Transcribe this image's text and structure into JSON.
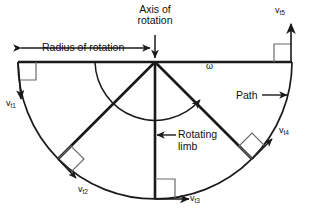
{
  "diagram": {
    "title_note": "Tangential velocity around an axis of rotation",
    "labels": {
      "axis_of_rotation": "Axis of\nrotation",
      "axis_of_rotation_line1": "Axis of",
      "axis_of_rotation_line2": "rotation",
      "radius_of_rotation": "Radius of rotation",
      "path": "Path",
      "rotating_limb_line1": "Rotating",
      "rotating_limb_line2": "limb",
      "angular_velocity_symbol": "ω"
    },
    "velocity_labels": [
      {
        "id": "vt1",
        "base": "v",
        "sub": "t1",
        "angle_deg": 180
      },
      {
        "id": "vt2",
        "base": "v",
        "sub": "t2",
        "angle_deg": 135
      },
      {
        "id": "vt3",
        "base": "v",
        "sub": "t3",
        "angle_deg": 90
      },
      {
        "id": "vt4",
        "base": "v",
        "sub": "t4",
        "angle_deg": 45
      },
      {
        "id": "vt5",
        "base": "v",
        "sub": "t5",
        "angle_deg": 0
      }
    ],
    "geometry": {
      "hub_x": 155,
      "hub_y": 62,
      "radius": 137,
      "spoke_angles_deg": [
        180,
        135,
        90,
        45,
        0
      ],
      "omega_arc_radius": 60,
      "arc_span": "semicircle below the horizontal diameter"
    },
    "colors": {
      "stroke": "#1a1a1a",
      "text": "#111111",
      "background": "#ffffff",
      "marker": "#4a4a4a"
    }
  }
}
